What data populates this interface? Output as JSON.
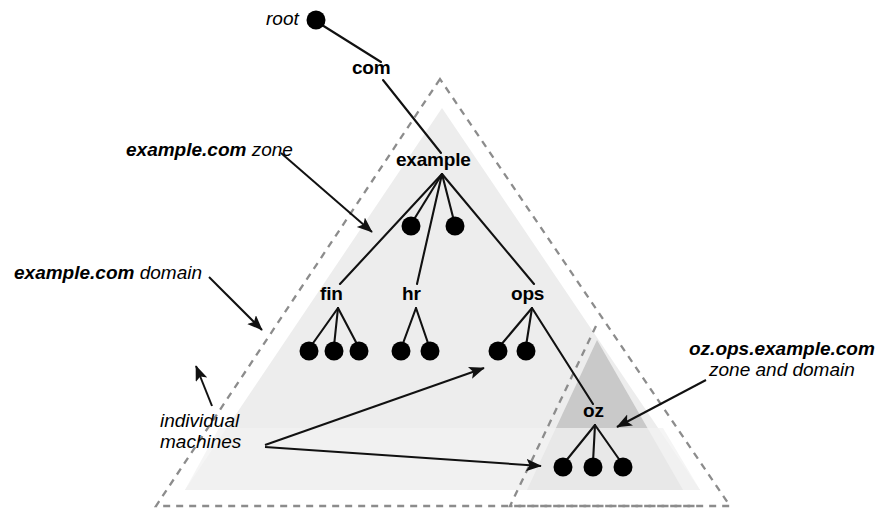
{
  "diagram": {
    "colors": {
      "background": "#ffffff",
      "line": "#1a1a1a",
      "dot": "#000000",
      "light_triangle": "#ededed",
      "dark_triangle": "#c9c9c9",
      "dashed_border": "#8c8c8c",
      "text": "#000000"
    },
    "root": {
      "label": "root",
      "x": 316,
      "y": 20
    },
    "nodes": [
      {
        "id": "com",
        "label": "com",
        "x": 382,
        "y": 68,
        "anchor_x": 382,
        "anchor_y": 78
      },
      {
        "id": "example",
        "label": "example",
        "x": 442,
        "y": 160,
        "anchor_x": 442,
        "anchor_y": 173
      },
      {
        "id": "fin",
        "label": "fin",
        "x": 338,
        "y": 294,
        "anchor_x": 338,
        "anchor_y": 307
      },
      {
        "id": "hr",
        "label": "hr",
        "x": 416,
        "y": 294,
        "anchor_x": 416,
        "anchor_y": 307
      },
      {
        "id": "ops",
        "label": "ops",
        "x": 532,
        "y": 294,
        "anchor_x": 532,
        "anchor_y": 307
      },
      {
        "id": "oz",
        "label": "oz",
        "x": 595,
        "y": 411,
        "anchor_x": 595,
        "anchor_y": 424
      }
    ],
    "machine_dots": [
      {
        "parent": "example",
        "x": 411,
        "y": 226
      },
      {
        "parent": "example",
        "x": 455,
        "y": 226
      },
      {
        "parent": "fin",
        "x": 309,
        "y": 351
      },
      {
        "parent": "fin",
        "x": 334,
        "y": 351
      },
      {
        "parent": "fin",
        "x": 359,
        "y": 351
      },
      {
        "parent": "hr",
        "x": 401,
        "y": 351
      },
      {
        "parent": "hr",
        "x": 430,
        "y": 351
      },
      {
        "parent": "ops",
        "x": 498,
        "y": 351
      },
      {
        "parent": "ops",
        "x": 526,
        "y": 351
      },
      {
        "parent": "oz",
        "x": 563,
        "y": 467
      },
      {
        "parent": "oz",
        "x": 593,
        "y": 467
      },
      {
        "parent": "oz",
        "x": 623,
        "y": 467
      }
    ],
    "annotations": [
      {
        "id": "example-com-zone",
        "strong_text": "example.com",
        "plain_text": " zone",
        "x": 126,
        "y": 140,
        "arrow": {
          "x1": 281,
          "y1": 153,
          "x2": 372,
          "y2": 232
        }
      },
      {
        "id": "example-com-domain",
        "strong_text": "example.com",
        "plain_text": " domain",
        "x": 14,
        "y": 263,
        "arrow": {
          "x1": 209,
          "y1": 277,
          "x2": 262,
          "y2": 329
        }
      },
      {
        "id": "oz-zone-domain",
        "strong_text": "oz.ops.example.com",
        "plain_text": "zone and domain",
        "x": 689,
        "y": 341,
        "arrow": {
          "x1": 706,
          "y1": 380,
          "x2": 617,
          "y2": 426
        }
      },
      {
        "id": "individual-machines",
        "line1": "individual",
        "line2": "machines",
        "x": 160,
        "y": 413,
        "arrows": [
          {
            "x1": 213,
            "y1": 405,
            "x2": 196,
            "y2": 364
          },
          {
            "x1": 262,
            "y1": 445,
            "x2": 487,
            "y2": 367
          },
          {
            "x1": 262,
            "y1": 447,
            "x2": 544,
            "y2": 466
          }
        ]
      }
    ],
    "zones": [
      {
        "id": "example-com-zone-region",
        "label": "example.com zone",
        "shape": "triangle",
        "fill": "#ededed",
        "points": "442,108 185,490 700,490"
      },
      {
        "id": "oz-ops-example-com-region",
        "label": "oz.ops.example.com zone and domain",
        "shape": "triangle",
        "fill": "#c9c9c9",
        "points": "597,340 527,490 683,490"
      },
      {
        "id": "example-com-domain-boundary",
        "label": "example.com domain",
        "shape": "dashed-triangle",
        "points": "440,79 156,506 730,506"
      },
      {
        "id": "oz-zone-boundary",
        "label": "oz zone boundary",
        "shape": "dashed-triangle",
        "points": "596,326 510,506 700,506"
      }
    ]
  }
}
